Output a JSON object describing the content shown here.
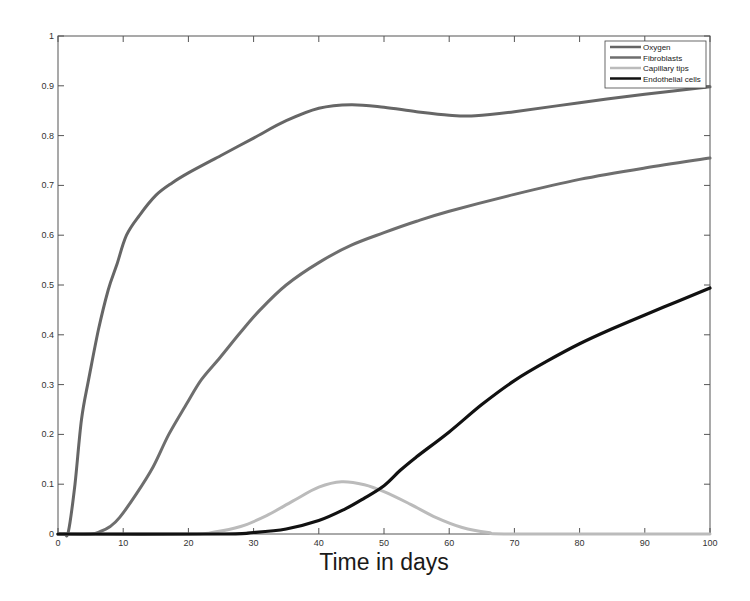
{
  "chart_data": {
    "type": "line",
    "title": "",
    "xlabel": "Time in days",
    "ylabel": "",
    "xlim": [
      0,
      100
    ],
    "ylim": [
      0,
      1
    ],
    "grid": false,
    "legend_position": "upper right (inside)",
    "x_ticks": [
      0,
      10,
      20,
      30,
      40,
      50,
      60,
      70,
      80,
      90,
      100
    ],
    "x_tick_labels": [
      "0",
      "10",
      "20",
      "30",
      "40",
      "50",
      "60",
      "70",
      "80",
      "90",
      "100"
    ],
    "y_ticks": [
      0,
      0.1,
      0.2,
      0.3,
      0.4,
      0.5,
      0.6,
      0.7,
      0.8,
      0.9,
      1
    ],
    "y_tick_labels": [
      "0",
      "0.1",
      "0.2",
      "0.3",
      "0.4",
      "0.5",
      "0.6",
      "0.7",
      "0.8",
      "0.9",
      "1"
    ],
    "series": [
      {
        "name": "Oxygen",
        "color": "#666666",
        "width": 3,
        "x": [
          0,
          1,
          1.6,
          2.6,
          3.6,
          4.7,
          6.2,
          7.7,
          9,
          10.5,
          12.5,
          15,
          17.5,
          20,
          25,
          30,
          35,
          40,
          45,
          50,
          55,
          60,
          64,
          70,
          80,
          90,
          100
        ],
        "y": [
          0,
          0,
          0.005,
          0.1,
          0.23,
          0.31,
          0.41,
          0.49,
          0.54,
          0.6,
          0.64,
          0.68,
          0.705,
          0.725,
          0.76,
          0.795,
          0.83,
          0.855,
          0.862,
          0.857,
          0.848,
          0.841,
          0.84,
          0.848,
          0.866,
          0.883,
          0.898
        ]
      },
      {
        "name": "Fibroblasts",
        "color": "#6e6e6e",
        "width": 3,
        "x": [
          0,
          5,
          6.5,
          8,
          9.5,
          12,
          14.6,
          17,
          19.8,
          22,
          24.9,
          28,
          31,
          35,
          40,
          45,
          50,
          55,
          60,
          70,
          80,
          90,
          100
        ],
        "y": [
          0,
          0,
          0.005,
          0.015,
          0.034,
          0.08,
          0.135,
          0.2,
          0.263,
          0.31,
          0.355,
          0.405,
          0.45,
          0.5,
          0.545,
          0.58,
          0.605,
          0.628,
          0.648,
          0.682,
          0.712,
          0.735,
          0.755
        ]
      },
      {
        "name": "Capillary tips",
        "color": "#bbbbbb",
        "width": 3,
        "x": [
          0,
          20,
          24,
          28,
          32,
          36,
          40,
          43.5,
          47,
          50,
          54,
          58,
          62,
          66,
          70,
          100
        ],
        "y": [
          0,
          0,
          0.004,
          0.015,
          0.037,
          0.066,
          0.094,
          0.105,
          0.099,
          0.085,
          0.06,
          0.033,
          0.013,
          0.003,
          0,
          0
        ]
      },
      {
        "name": "Endothelial cells",
        "color": "#111111",
        "width": 3.2,
        "x": [
          0,
          25,
          30,
          35,
          40,
          44,
          47,
          50,
          52.5,
          55,
          60,
          65,
          70,
          75,
          80,
          85,
          90,
          95,
          100
        ],
        "y": [
          0,
          0,
          0.003,
          0.01,
          0.027,
          0.05,
          0.072,
          0.097,
          0.128,
          0.155,
          0.205,
          0.26,
          0.308,
          0.347,
          0.382,
          0.412,
          0.44,
          0.467,
          0.494
        ]
      }
    ]
  },
  "legend": {
    "items": [
      {
        "label": "Oxygen",
        "color": "#666666"
      },
      {
        "label": "Fibroblasts",
        "color": "#6e6e6e"
      },
      {
        "label": "Capillary tips",
        "color": "#bbbbbb"
      },
      {
        "label": "Endothelial cells",
        "color": "#111111"
      }
    ]
  },
  "axes": {
    "xlabel": "Time in days"
  }
}
